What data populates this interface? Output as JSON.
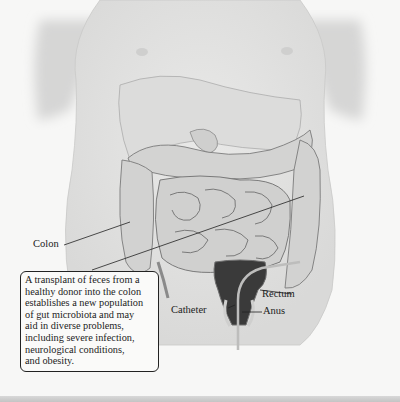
{
  "figure": {
    "labels": {
      "colon": "Colon",
      "rectum": "Rectum",
      "catheter": "Catheter",
      "anus": "Anus"
    },
    "caption": {
      "lines": [
        "A transplant of feces from a",
        "healthy donor into the colon",
        "establishes a new population",
        "of gut microbiota and may",
        "aid in diverse problems,",
        "including severe infection,",
        "neurological conditions,",
        "and obesity."
      ]
    },
    "colors": {
      "background": "#f7f7f6",
      "body": "#e4e4e3",
      "organ": "#d2d2d1",
      "organ_outline": "#8a8a8a",
      "catheter": "#222222",
      "text": "#222222"
    }
  }
}
